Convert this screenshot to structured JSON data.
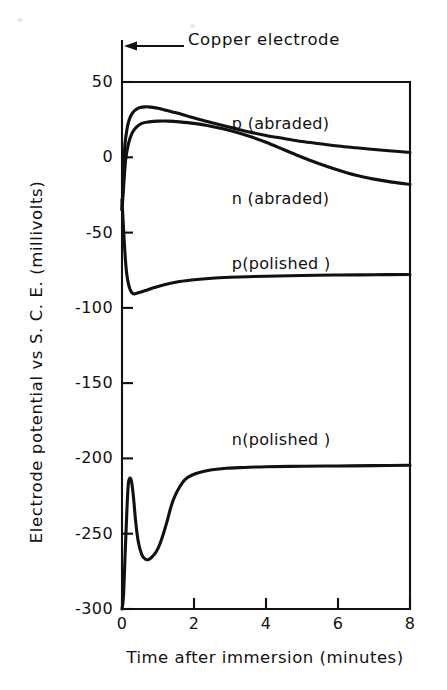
{
  "figure": {
    "background": "#ffffff",
    "ink_color": "#111111"
  },
  "annotations": {
    "copper_electrode": "Copper electrode"
  },
  "chart_data": {
    "type": "line",
    "title": "",
    "xlabel": "Time after immersion  (minutes)",
    "ylabel": "Electrode potential vs S. C. E. (millivolts)",
    "xlim": [
      0,
      8
    ],
    "ylim": [
      -300,
      50
    ],
    "xticks": [
      0,
      2,
      4,
      6,
      8
    ],
    "xtick_labels": [
      "0",
      "2",
      "4",
      "6",
      "8"
    ],
    "yticks": [
      50,
      0,
      -50,
      -100,
      -150,
      -200,
      -250,
      -300
    ],
    "ytick_labels": [
      "50",
      "0",
      "-50",
      "-100",
      "-150",
      "-200",
      "-250",
      "-300"
    ],
    "grid": false,
    "legend": "inline-annotations",
    "series": [
      {
        "name": "p (abraded)",
        "label_x": 3.05,
        "label_y": 22,
        "color": "#111111",
        "x": [
          0.0,
          0.04,
          0.08,
          0.14,
          0.2,
          0.28,
          0.38,
          0.5,
          0.65,
          0.8,
          1.0,
          1.25,
          1.5,
          1.8,
          2.1,
          2.5,
          3.0,
          3.5,
          4.0,
          4.5,
          5.0,
          5.5,
          6.0,
          6.5,
          7.0,
          7.5,
          8.0
        ],
        "y": [
          -35,
          -10,
          8,
          19,
          25,
          29,
          31.5,
          33,
          33.5,
          33.3,
          32.5,
          31,
          29.5,
          27.5,
          25.5,
          23,
          20,
          17,
          14.5,
          12.5,
          10.5,
          9,
          7.5,
          6.3,
          5.2,
          4.2,
          3.2
        ]
      },
      {
        "name": "n (abraded)",
        "label_x": 3.05,
        "label_y": -28,
        "color": "#111111",
        "x": [
          0.0,
          0.05,
          0.1,
          0.18,
          0.28,
          0.4,
          0.55,
          0.75,
          1.0,
          1.3,
          1.6,
          2.0,
          2.4,
          2.8,
          3.2,
          3.6,
          4.0,
          4.5,
          5.0,
          5.5,
          6.0,
          6.5,
          7.0,
          7.5,
          8.0
        ],
        "y": [
          -35,
          -18,
          -2,
          9,
          16,
          20,
          22.5,
          23.5,
          24,
          24,
          23.5,
          22.5,
          21,
          19,
          16.5,
          13.5,
          10,
          5,
          0,
          -4.5,
          -8.5,
          -12,
          -14.5,
          -16.5,
          -18
        ]
      },
      {
        "name": "p(polished )",
        "label_x": 3.05,
        "label_y": -71,
        "color": "#111111",
        "x": [
          0.0,
          0.06,
          0.12,
          0.2,
          0.3,
          0.45,
          0.65,
          0.9,
          1.2,
          1.6,
          2.0,
          2.5,
          3.0,
          3.5,
          4.0,
          5.0,
          6.0,
          7.0,
          8.0
        ],
        "y": [
          -28,
          -55,
          -75,
          -86,
          -90.5,
          -90,
          -88.5,
          -86.5,
          -84.5,
          -82.5,
          -81.3,
          -80.3,
          -79.7,
          -79.3,
          -79,
          -78.5,
          -78.2,
          -78.0,
          -77.8
        ]
      },
      {
        "name": "n(polished )",
        "label_x": 3.05,
        "label_y": -188,
        "color": "#111111",
        "x": [
          0.0,
          0.04,
          0.09,
          0.14,
          0.18,
          0.23,
          0.27,
          0.32,
          0.38,
          0.45,
          0.55,
          0.65,
          0.75,
          0.85,
          0.95,
          1.05,
          1.15,
          1.25,
          1.35,
          1.45,
          1.6,
          1.75,
          1.95,
          2.2,
          2.5,
          2.9,
          3.4,
          4.0,
          5.0,
          6.0,
          7.0,
          8.0
        ],
        "y": [
          -300,
          -292,
          -262,
          -232,
          -216,
          -213,
          -216,
          -226,
          -242,
          -255,
          -264,
          -267,
          -267,
          -265,
          -262,
          -257,
          -250,
          -242,
          -233,
          -226,
          -219,
          -214,
          -211,
          -209,
          -207.5,
          -206.5,
          -206,
          -205.5,
          -205.2,
          -205.0,
          -204.8,
          -204.5
        ]
      }
    ]
  }
}
